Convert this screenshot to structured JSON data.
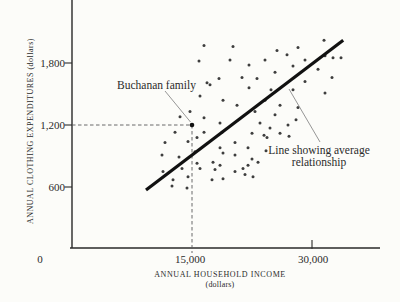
{
  "figure": {
    "y_axis_label": "ANNUAL CLOTHING EXPENDITURES (dollars)",
    "x_axis_label": "ANNUAL HOUSEHOLD INCOME",
    "x_axis_sublabel": "(dollars)",
    "origin_label": "0"
  },
  "chart_data": {
    "type": "scatter",
    "title": "",
    "xlabel": "ANNUAL HOUSEHOLD INCOME (dollars)",
    "ylabel": "ANNUAL CLOTHING EXPENDITURES (dollars)",
    "xlim": [
      0,
      38500
    ],
    "ylim": [
      0,
      2400
    ],
    "grid": false,
    "x_ticks": [
      {
        "value": 15000,
        "label": "15,000"
      },
      {
        "value": 30000,
        "label": "30,000"
      }
    ],
    "y_ticks": [
      {
        "value": 600,
        "label": "600"
      },
      {
        "value": 1200,
        "label": "1,200"
      },
      {
        "value": 1800,
        "label": "1,800"
      }
    ],
    "points": [
      [
        16500,
        1970
      ],
      [
        20125,
        1960
      ],
      [
        25625,
        1920
      ],
      [
        28250,
        1950
      ],
      [
        31500,
        2020
      ],
      [
        15875,
        1820
      ],
      [
        19750,
        1830
      ],
      [
        24125,
        1830
      ],
      [
        26875,
        1880
      ],
      [
        29125,
        1830
      ],
      [
        31625,
        1870
      ],
      [
        32625,
        1850
      ],
      [
        33625,
        1850
      ],
      [
        22125,
        1780
      ],
      [
        27625,
        1770
      ],
      [
        30750,
        1740
      ],
      [
        25375,
        1710
      ],
      [
        32500,
        1660
      ],
      [
        21250,
        1660
      ],
      [
        23125,
        1650
      ],
      [
        18375,
        1650
      ],
      [
        16875,
        1610
      ],
      [
        29125,
        1620
      ],
      [
        22125,
        1560
      ],
      [
        27625,
        1540
      ],
      [
        16000,
        1480
      ],
      [
        17250,
        1590
      ],
      [
        31625,
        1510
      ],
      [
        24875,
        1540
      ],
      [
        18875,
        1440
      ],
      [
        20625,
        1390
      ],
      [
        24125,
        1440
      ],
      [
        26000,
        1390
      ],
      [
        28250,
        1370
      ],
      [
        14750,
        1330
      ],
      [
        22875,
        1330
      ],
      [
        25375,
        1300
      ],
      [
        13500,
        1280
      ],
      [
        16500,
        1270
      ],
      [
        28000,
        1250
      ],
      [
        18500,
        1220
      ],
      [
        23500,
        1220
      ],
      [
        24750,
        1170
      ],
      [
        27000,
        1200
      ],
      [
        22500,
        1120
      ],
      [
        24000,
        1100
      ],
      [
        26000,
        1120
      ],
      [
        27125,
        1090
      ],
      [
        12875,
        1130
      ],
      [
        16500,
        1130
      ],
      [
        18750,
        1130
      ],
      [
        24375,
        1080
      ],
      [
        15625,
        1080
      ],
      [
        20375,
        1030
      ],
      [
        11625,
        1030
      ],
      [
        14500,
        1040
      ],
      [
        22000,
        980
      ],
      [
        18500,
        980
      ],
      [
        24250,
        950
      ],
      [
        15375,
        940
      ],
      [
        11250,
        910
      ],
      [
        18875,
        930
      ],
      [
        20375,
        910
      ],
      [
        22500,
        870
      ],
      [
        13375,
        890
      ],
      [
        23250,
        840
      ],
      [
        22000,
        810
      ],
      [
        15625,
        830
      ],
      [
        17625,
        840
      ],
      [
        18500,
        810
      ],
      [
        21375,
        780
      ],
      [
        11375,
        750
      ],
      [
        13750,
        780
      ],
      [
        16000,
        780
      ],
      [
        17875,
        770
      ],
      [
        20375,
        750
      ],
      [
        21625,
        720
      ],
      [
        22625,
        700
      ],
      [
        12625,
        670
      ],
      [
        14500,
        700
      ],
      [
        17500,
        670
      ],
      [
        18875,
        680
      ],
      [
        12500,
        610
      ],
      [
        14375,
        590
      ]
    ],
    "highlight_point": {
      "label": "Buchanan family",
      "income": 15000,
      "expenditure": 1200
    },
    "trend_line": {
      "label": "Line showing average relationship",
      "from": [
        9250,
        570
      ],
      "to": [
        33900,
        2020
      ]
    },
    "annotations": {
      "buchanan": "Buchanan family",
      "line_label_1": "Line showing average",
      "line_label_2": "relationship"
    },
    "colors": {
      "axis": "#2a2a2a",
      "dot": "#3e3e3e",
      "line": "#111111",
      "guide": "#5a5a5a",
      "callout": "#8a8a8a",
      "background": "#fcfcf9"
    }
  }
}
